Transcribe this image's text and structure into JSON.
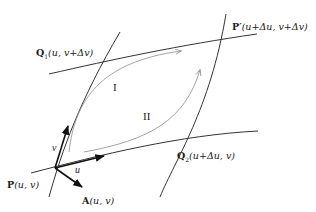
{
  "diagram": {
    "points": {
      "P": {
        "name": "P",
        "args": "(u, v)"
      },
      "P_prime": {
        "name": "P′",
        "args": "(u+Δu, v+Δv)"
      },
      "Q1": {
        "name": "Q",
        "sub": "1",
        "args": "(u, v+Δv)"
      },
      "Q2": {
        "name": "Q",
        "sub": "2",
        "args": "(u+Δu, v)"
      },
      "A": {
        "name": "A",
        "args": "(u, v)"
      }
    },
    "regions": {
      "I": "I",
      "II": "II"
    },
    "vectors": {
      "u": "u",
      "v": "v"
    },
    "colors": {
      "line": "#222222",
      "path": "#9a9a9a"
    }
  }
}
